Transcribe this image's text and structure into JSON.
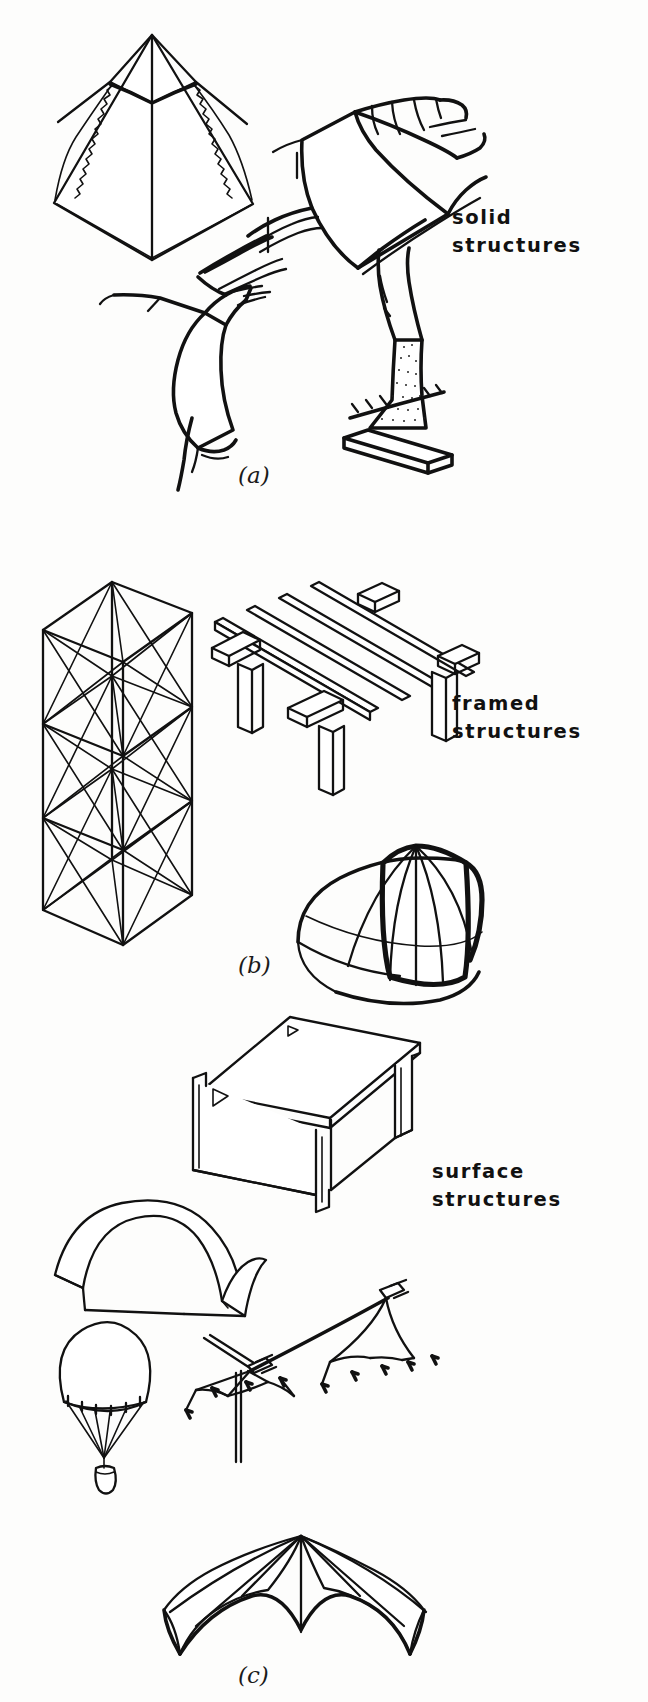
{
  "figure": {
    "background_color": "#fdfdfc",
    "ink_color": "#111111"
  },
  "panels": [
    {
      "id": "a",
      "caption": "(a)",
      "label_lines": [
        "solid",
        "structures"
      ],
      "label_text": "solid structures",
      "caption_x": 238,
      "caption_y": 462,
      "label_x": 452,
      "label_y": 204,
      "illustrations": [
        {
          "name": "pyramid",
          "description": "stepped masonry pyramid in isometric view"
        },
        {
          "name": "arch-dam",
          "description": "curved concrete arch dam wedged between canyon walls"
        },
        {
          "name": "rock-outcrop",
          "description": "faceted rock formation / gravity retaining mass"
        },
        {
          "name": "concrete-buttress",
          "description": "stippled concrete buttress footing on ground hatching"
        }
      ]
    },
    {
      "id": "b",
      "caption": "(b)",
      "label_lines": [
        "framed",
        "structures"
      ],
      "label_text": "framed structures",
      "caption_x": 238,
      "caption_y": 952,
      "label_x": 452,
      "label_y": 690,
      "illustrations": [
        {
          "name": "braced-tower",
          "description": "three-tier cross-braced lattice tower"
        },
        {
          "name": "post-and-beam-deck",
          "description": "timber deck of joists on cross beams and posts"
        },
        {
          "name": "ribbed-dome",
          "description": "ribbed geodesic-style dome with ring beam"
        }
      ]
    },
    {
      "id": "c",
      "caption": "(c)",
      "label_lines": [
        "surface",
        "structures"
      ],
      "label_text": "surface structures",
      "caption_x": 238,
      "caption_y": 1662,
      "label_x": 432,
      "label_y": 1158,
      "illustrations": [
        {
          "name": "folded-plate-slab",
          "description": "folded plate / channel slab on two web walls"
        },
        {
          "name": "barrel-vault-shell",
          "description": "cylindrical barrel vault thin shell"
        },
        {
          "name": "parachute",
          "description": "parachute canopy with suspension lines and payload"
        },
        {
          "name": "ridge-tent",
          "description": "guyed tent membrane on mast with pegged stay lines"
        },
        {
          "name": "tensile-canopy",
          "description": "radial tensile membrane canopy with scalloped edges"
        }
      ]
    }
  ]
}
